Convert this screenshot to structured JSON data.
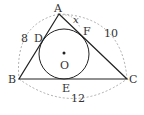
{
  "diagram": {
    "points": {
      "A": {
        "label": "A",
        "x": 59,
        "y": 14
      },
      "B": {
        "label": "B",
        "x": 19,
        "y": 79
      },
      "C": {
        "label": "C",
        "x": 127,
        "y": 79
      },
      "O": {
        "label": "O",
        "x": 64,
        "y": 54
      }
    },
    "tangent_points": {
      "D": {
        "label": "D"
      },
      "E": {
        "label": "E"
      },
      "F": {
        "label": "F"
      }
    },
    "incircle": {
      "cx": 64,
      "cy": 54,
      "r": 25
    },
    "side_lengths": {
      "AB": "8",
      "AC": "10",
      "BC": "12"
    },
    "unknown": {
      "label": "x",
      "segment": "AF"
    },
    "colors": {
      "stroke": "#222222",
      "dashed": "#999999",
      "text": "#333333"
    }
  }
}
